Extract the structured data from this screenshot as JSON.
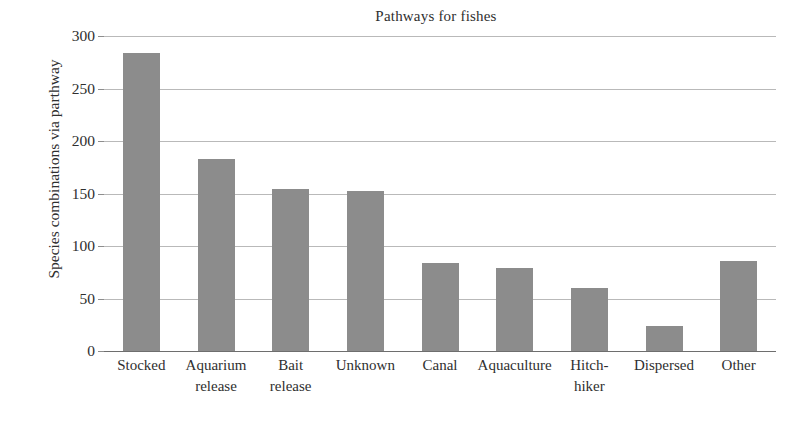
{
  "chart_data": {
    "type": "bar",
    "title": "Pathways for fishes",
    "xlabel": "",
    "ylabel": "Species combinations via parthway",
    "categories": [
      "Stocked",
      "Aquarium release",
      "Bait release",
      "Unknown",
      "Canal",
      "Aquaculture",
      "Hitch-hiker",
      "Dispersed",
      "Other"
    ],
    "category_lines": [
      [
        "Stocked"
      ],
      [
        "Aquarium",
        "release"
      ],
      [
        "Bait",
        "release"
      ],
      [
        "Unknown"
      ],
      [
        "Canal"
      ],
      [
        "Aquaculture"
      ],
      [
        "Hitch-",
        "hiker"
      ],
      [
        "Dispersed"
      ],
      [
        "Other"
      ]
    ],
    "values": [
      284,
      183,
      154,
      152,
      84,
      79,
      60,
      24,
      86
    ],
    "ylim": [
      0,
      300
    ],
    "yticks": [
      0,
      50,
      100,
      150,
      200,
      250,
      300
    ],
    "ytick_labels": [
      "0",
      "50",
      "100",
      "150",
      "200",
      "250",
      "300"
    ],
    "grid": true,
    "legend": null,
    "bar_color": "#8c8c8c",
    "gridline_color": "#b9b9b9",
    "axis_color": "#6e6e6e",
    "background": "#ffffff"
  }
}
